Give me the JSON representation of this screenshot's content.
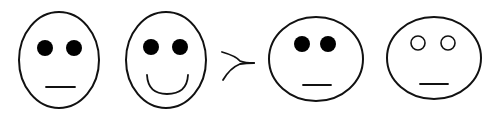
{
  "diagram": {
    "colors": {
      "stroke": "#111111",
      "fill": "#ffffff",
      "eye": "#000000"
    },
    "groups": [
      {
        "faces": [
          {
            "id": "face-1",
            "shape": "tall-oval",
            "eyes": "filled",
            "mouth": "neutral"
          },
          {
            "id": "face-2",
            "shape": "tall-oval",
            "eyes": "filled",
            "mouth": "smile"
          }
        ]
      },
      {
        "faces": [
          {
            "id": "face-3",
            "shape": "wide-oval",
            "eyes": "filled",
            "mouth": "neutral"
          },
          {
            "id": "face-4",
            "shape": "wide-oval",
            "eyes": "hollow",
            "mouth": "neutral"
          }
        ]
      }
    ],
    "relation": {
      "symbol": "≻",
      "meaning": "succeeds / is preferred to"
    }
  }
}
